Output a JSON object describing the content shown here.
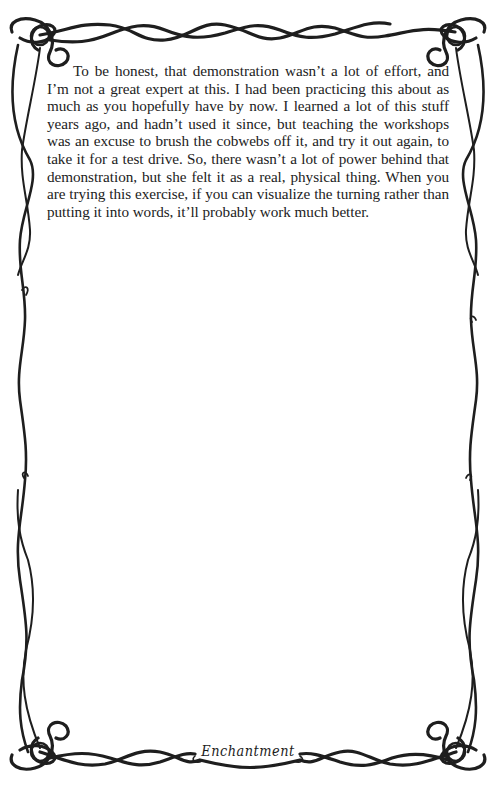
{
  "page": {
    "paragraphs": [
      "To be honest, that demonstration wasn’t a lot of effort, and I’m not a great expert at this. I had been practicing this about as much as you hopefully have by now. I learned a lot of this stuff years ago, and hadn’t used it since, but teaching the workshops was an excuse to brush the cobwebs off it, and try it out again, to take it for a test drive. So, there wasn’t a lot of power behind that demonstration, but she felt it as a real, physical thing. When you are trying this exercise, if you can visualize the turning rather than putting it into words, it’ll probably work much better."
    ],
    "footer_title": "Enchantment"
  },
  "decoration": {
    "border_style": "celtic-knot-vine",
    "border_color": "#1e1e1e",
    "icons": [
      "celtic-knot-top-left-icon",
      "celtic-knot-top-right-icon",
      "celtic-knot-bottom-left-icon",
      "celtic-knot-bottom-right-icon"
    ]
  }
}
